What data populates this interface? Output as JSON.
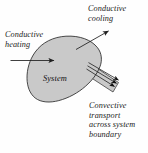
{
  "figure": {
    "title_visible": false,
    "background_color": "#fefefe",
    "system_fill_color": "#c9c9c9",
    "outline_color": "#2b2b2b",
    "text_color": "#1a1a1a",
    "labels": {
      "conductive_cooling": "Conductive\ncooling",
      "conductive_heating": "Conductive\nheating",
      "system": "System",
      "convective_transport": "Convective\ntransport\nacross system\nboundary"
    },
    "icon_names": {
      "system_blob": "system-blob-shape",
      "heating_arrow": "arrow-right-icon",
      "cooling_arrow": "arrow-up-right-icon",
      "convective_tube": "convective-tube-shape",
      "convective_arrows": "triple-arrow-icon"
    },
    "arrow_counts": {
      "conductive_heating": 1,
      "conductive_cooling": 1,
      "convective_transport": 3
    }
  }
}
